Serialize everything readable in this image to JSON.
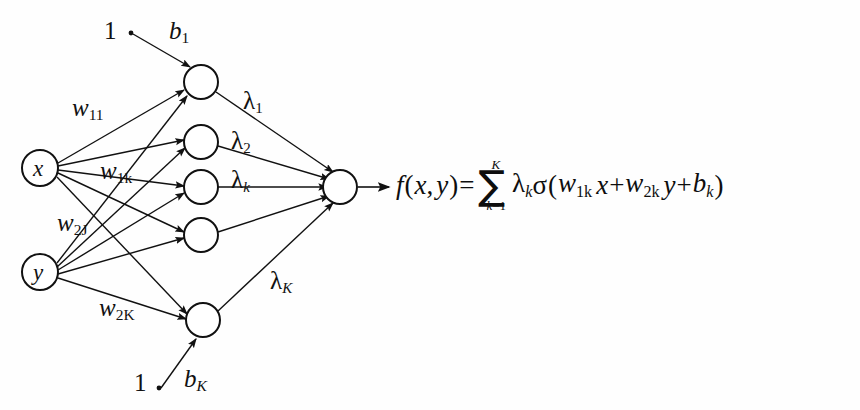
{
  "diagram": {
    "ink_color": "#111111",
    "background": "#ffffff",
    "input_nodes": [
      {
        "id": "x",
        "label": "x",
        "cx": 40,
        "cy": 168,
        "r": 18
      },
      {
        "id": "y",
        "label": "y",
        "cx": 40,
        "cy": 272,
        "r": 18
      }
    ],
    "hidden_nodes": [
      {
        "id": "h1",
        "cx": 201,
        "cy": 82,
        "r": 17
      },
      {
        "id": "h2",
        "cx": 201,
        "cy": 142,
        "r": 17
      },
      {
        "id": "h3",
        "cx": 201,
        "cy": 187,
        "r": 17
      },
      {
        "id": "h4",
        "cx": 201,
        "cy": 235,
        "r": 17
      },
      {
        "id": "h5",
        "cx": 203,
        "cy": 320,
        "r": 17
      }
    ],
    "output_node": {
      "id": "out",
      "cx": 340,
      "cy": 187,
      "r": 17
    },
    "bias_sources": [
      {
        "id": "bias_top",
        "label": "1",
        "x": 104,
        "y": 18,
        "dot_x": 131,
        "dot_y": 33
      },
      {
        "id": "bias_bottom",
        "label": "1",
        "x": 134,
        "y": 370,
        "dot_x": 159,
        "dot_y": 388
      }
    ],
    "bias_labels": [
      {
        "id": "b_1",
        "base": "b",
        "sub": "1",
        "sub_italic": false,
        "x": 169,
        "y": 18
      },
      {
        "id": "b_K",
        "base": "b",
        "sub": "K",
        "sub_italic": true,
        "x": 184,
        "y": 366
      }
    ],
    "weight_labels": [
      {
        "id": "w_11",
        "base": "w",
        "sub": "11",
        "x": 72,
        "y": 95
      },
      {
        "id": "w_1k",
        "base": "w",
        "sub": "1k",
        "x": 100,
        "y": 158
      },
      {
        "id": "w_2j",
        "base": "w",
        "sub": "2J",
        "x": 57,
        "y": 210
      },
      {
        "id": "w_2K",
        "base": "w",
        "sub": "2K",
        "x": 99,
        "y": 295
      }
    ],
    "lambda_labels": [
      {
        "id": "lam_1",
        "base": "λ",
        "sub": "1",
        "sub_italic": false,
        "x": 243,
        "y": 88
      },
      {
        "id": "lam_2",
        "base": "λ",
        "sub": "2",
        "sub_italic": false,
        "x": 231,
        "y": 128
      },
      {
        "id": "lam_k",
        "base": "λ",
        "sub": "k",
        "sub_italic": true,
        "x": 231,
        "y": 167
      },
      {
        "id": "lam_K",
        "base": "λ",
        "sub": "K",
        "sub_italic": true,
        "x": 270,
        "y": 268
      }
    ],
    "formula": {
      "id": "network-output-formula",
      "plain": "f(x, y) = ∑_{k=1}^{K} λ_k σ(w_1k x + w_2k y + b_k)",
      "fn_name": "f",
      "open_paren": "(",
      "arg1": "x",
      "comma": ",",
      "arg2": "y",
      "close_paren": ")",
      "equals": "=",
      "sum_symbol": "∑",
      "sum_upper": "K",
      "sum_lower_var": "k",
      "sum_lower_eq": "=1",
      "lambda": "λ",
      "lambda_sub": "k",
      "sigma": "σ",
      "inner_open": "(",
      "w1": "w",
      "w1_sub": "1k",
      "x_var": "x",
      "plus1": "+",
      "w2": "w",
      "w2_sub": "2k",
      "y_var": "y",
      "plus2": "+",
      "b": "b",
      "b_sub": "k",
      "inner_close": ")"
    }
  }
}
